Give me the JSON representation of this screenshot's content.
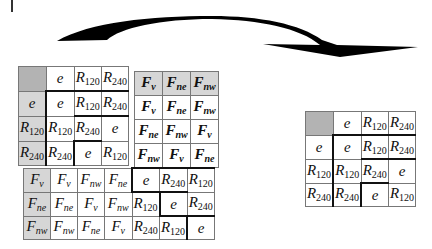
{
  "figure": {
    "arrow": {
      "direction": "left-to-right",
      "description": "curved black arrow from left composite tables to right table"
    }
  },
  "tables": {
    "rotation_table": {
      "header_row": [
        "",
        "e",
        "R120",
        "R240"
      ],
      "rows": [
        [
          "e",
          "e",
          "R120",
          "R240"
        ],
        [
          "R120",
          "R120",
          "R240",
          "e"
        ],
        [
          "R240",
          "R240",
          "e",
          "R120"
        ]
      ]
    },
    "reflection_table": {
      "header_row": [
        "Fv",
        "Fne",
        "Fnw"
      ],
      "rows": [
        [
          "Fv",
          "Fne",
          "Fnw"
        ],
        [
          "Fne",
          "Fnw",
          "Fv"
        ],
        [
          "Fnw",
          "Fv",
          "Fne"
        ]
      ]
    },
    "lower_table": {
      "rows": [
        [
          "Fv",
          "Fv",
          "Fnw",
          "Fne",
          "e",
          "R240",
          "R120"
        ],
        [
          "Fne",
          "Fne",
          "Fv",
          "Fnw",
          "R120",
          "e",
          "R240"
        ],
        [
          "Fnw",
          "Fnw",
          "Fne",
          "Fv",
          "R240",
          "R120",
          "e"
        ]
      ]
    },
    "result_table": {
      "header_row": [
        "",
        "e",
        "R120",
        "R240"
      ],
      "rows": [
        [
          "e",
          "e",
          "R120",
          "R240"
        ],
        [
          "R120",
          "R120",
          "R240",
          "e"
        ],
        [
          "R240",
          "R240",
          "e",
          "R120"
        ]
      ]
    }
  }
}
